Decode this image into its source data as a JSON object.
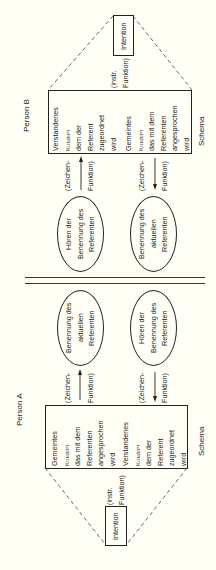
{
  "person_b": {
    "label": "Person B",
    "schema_label": "Schema",
    "intention": "Intention",
    "instr_line1": "(instr.",
    "instr_line2": "Funktion)",
    "concept_box": {
      "understood": [
        "Verstandenes",
        "Konzept",
        "dem der",
        "Referent",
        "zugeordnet",
        "wird"
      ],
      "intended": [
        "Gemeintes",
        "Konzept",
        "das mit dem",
        "Referenten",
        "angesprochen",
        "wird"
      ]
    },
    "sign_function_upper": {
      "line1": "(Zeichen-",
      "line2": "Funktion)",
      "arrow_direction": "toward-box"
    },
    "sign_function_lower": {
      "line1": "(Zeichen-",
      "line2": "Funktion)",
      "arrow_direction": "toward-ellipse"
    },
    "ellipse_hearing": [
      "Hören der",
      "Benennung des",
      "Referenten"
    ],
    "ellipse_naming": [
      "Benennung des",
      "aktuellen",
      "Referenten"
    ]
  },
  "person_a": {
    "label": "Person A",
    "schema_label": "Schema",
    "intention": "Intention",
    "instr_line1": "(instr.",
    "instr_line2": "Funktion)",
    "concept_box": {
      "intended": [
        "Gemeintes",
        "Konzept",
        "das mit dem",
        "Referenten",
        "angesprochen",
        "wird"
      ],
      "understood": [
        "Verstandenes",
        "Konzept",
        "dem der",
        "Referent",
        "zugeordnet",
        "wird"
      ]
    },
    "sign_function_upper": {
      "line1": "(Zeichen-",
      "line2": "Funktion)",
      "arrow_direction": "toward-ellipse"
    },
    "sign_function_lower": {
      "line1": "(Zeichen-",
      "line2": "Funktion)",
      "arrow_direction": "toward-box"
    },
    "ellipse_naming": [
      "Benennung des",
      "aktuellen",
      "Referenten"
    ],
    "ellipse_hearing": [
      "Hören der",
      "Benennung des",
      "Referenten"
    ]
  },
  "colors": {
    "background": "#fffff6",
    "ink": "#1a1a1a"
  }
}
